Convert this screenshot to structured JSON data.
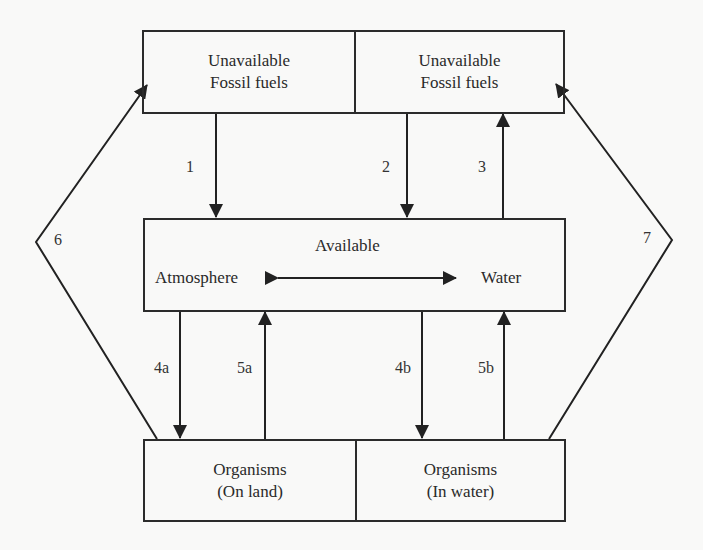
{
  "diagram": {
    "boxes": {
      "top": {
        "left": {
          "line1": "Unavailable",
          "line2": "Fossil fuels"
        },
        "right": {
          "line1": "Unavailable",
          "line2": "Fossil fuels"
        }
      },
      "middle": {
        "heading": "Available",
        "left_label": "Atmosphere",
        "right_label": "Water"
      },
      "bottom": {
        "left": {
          "line1": "Organisms",
          "line2": "(On land)"
        },
        "right": {
          "line1": "Organisms",
          "line2": "(In water)"
        }
      }
    },
    "arrows": [
      {
        "id": "1",
        "label": "1",
        "from": "Unavailable Fossil fuels (left)",
        "to": "Available",
        "direction": "down"
      },
      {
        "id": "2",
        "label": "2",
        "from": "Unavailable Fossil fuels (right)",
        "to": "Available",
        "direction": "down"
      },
      {
        "id": "3",
        "label": "3",
        "from": "Available",
        "to": "Unavailable Fossil fuels (right)",
        "direction": "up"
      },
      {
        "id": "4a",
        "label": "4a",
        "from": "Available (Atmosphere)",
        "to": "Organisms (On land)",
        "direction": "down"
      },
      {
        "id": "5a",
        "label": "5a",
        "from": "Organisms (On land)",
        "to": "Available (Atmosphere)",
        "direction": "up"
      },
      {
        "id": "4b",
        "label": "4b",
        "from": "Available (Water)",
        "to": "Organisms (In water)",
        "direction": "down"
      },
      {
        "id": "5b",
        "label": "5b",
        "from": "Organisms (In water)",
        "to": "Available (Water)",
        "direction": "up"
      },
      {
        "id": "6",
        "label": "6",
        "from": "Organisms (On land)",
        "to": "Unavailable Fossil fuels (left)",
        "direction": "up-left"
      },
      {
        "id": "7",
        "label": "7",
        "from": "Organisms (In water)",
        "to": "Unavailable Fossil fuels (right)",
        "direction": "up-right"
      }
    ],
    "exchange": {
      "between": [
        "Atmosphere",
        "Water"
      ],
      "type": "bidirectional"
    }
  }
}
